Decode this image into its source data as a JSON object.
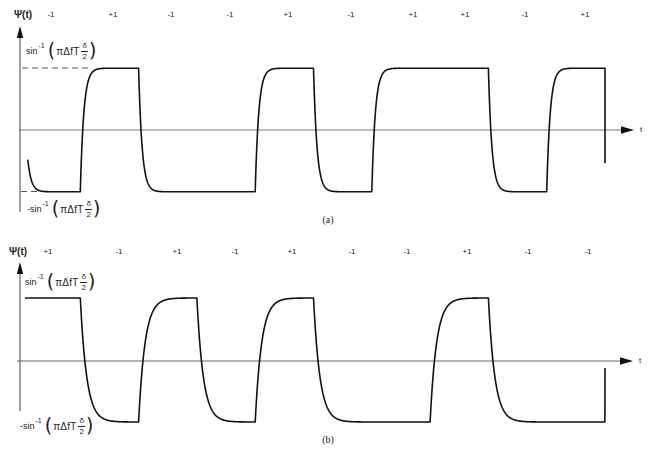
{
  "chart_data": [
    {
      "type": "line",
      "title": "",
      "panel_label": "(a)",
      "ylabel": "Ψ(t)",
      "xlabel": "t",
      "bits": [
        -1,
        1,
        -1,
        -1,
        1,
        -1,
        1,
        1,
        -1,
        1
      ],
      "bit_labels": [
        "-1",
        "+1",
        "-1",
        "-1",
        "+1",
        "-1",
        "+1",
        "+1",
        "-1",
        "+1"
      ],
      "y_tick_labels": {
        "high": {
          "text": "sin⁻¹(πΔfT δ/2)",
          "sign": "",
          "func": "sin",
          "exponent": "-1",
          "open": "(",
          "argument": "πΔfT",
          "numerator": "δ",
          "denominator": "2",
          "close": ")"
        },
        "low": {
          "text": "-sin⁻¹(πΔfT δ/2)",
          "sign": "-",
          "func": "sin",
          "exponent": "-1",
          "open": "(",
          "argument": "πΔfT",
          "numerator": "δ",
          "denominator": "2",
          "close": ")"
        }
      },
      "ylim": [
        -1,
        1
      ],
      "xlim": [
        0,
        10
      ],
      "grid": false,
      "legend_position": "none",
      "waveform": {
        "start_t": 0.1,
        "start_y": -0.48,
        "end_t": 10,
        "end_y": -0.54,
        "time_constant": 0.06
      },
      "transitions": [
        {
          "t": 1,
          "from": -1,
          "to": 1
        },
        {
          "t": 2,
          "from": 1,
          "to": -1
        },
        {
          "t": 4,
          "from": -1,
          "to": 1
        },
        {
          "t": 5,
          "from": 1,
          "to": -1
        },
        {
          "t": 6,
          "from": -1,
          "to": 1
        },
        {
          "t": 8,
          "from": 1,
          "to": -1
        },
        {
          "t": 9,
          "from": -1,
          "to": 1
        },
        {
          "t": 10,
          "from": 1,
          "to": -0.54
        }
      ]
    },
    {
      "type": "line",
      "title": "",
      "panel_label": "(b)",
      "ylabel": "Ψ(t)",
      "xlabel": "t",
      "bits": [
        1,
        -1,
        1,
        -1,
        1,
        -1,
        -1,
        1,
        -1,
        -1
      ],
      "bit_labels": [
        "+1",
        "-1",
        "+1",
        "-1",
        "+1",
        "-1",
        "-1",
        "+1",
        "-1",
        "-1"
      ],
      "y_tick_labels": {
        "high": {
          "text": "sin⁻¹(πΔfT δ/2)",
          "sign": "",
          "func": "sin",
          "exponent": "-1",
          "open": "(",
          "argument": "πΔfT",
          "numerator": "δ",
          "denominator": "2",
          "close": ")"
        },
        "low": {
          "text": "-sin⁻¹(πΔfT δ/2)",
          "sign": "-",
          "func": "sin",
          "exponent": "-1",
          "open": "(",
          "argument": "πΔfT",
          "numerator": "δ",
          "denominator": "2",
          "close": ")"
        }
      },
      "ylim": [
        -1,
        1
      ],
      "xlim": [
        0,
        10
      ],
      "grid": false,
      "legend_position": "none",
      "waveform": {
        "start_t": 0.05,
        "start_y": 1,
        "end_t": 10,
        "end_y": -0.13,
        "time_constant": 0.11
      },
      "transitions": [
        {
          "t": 1,
          "from": 1,
          "to": -1
        },
        {
          "t": 2,
          "from": -1,
          "to": 1
        },
        {
          "t": 3,
          "from": 1,
          "to": -1
        },
        {
          "t": 4,
          "from": -1,
          "to": 1
        },
        {
          "t": 5,
          "from": 1,
          "to": -1
        },
        {
          "t": 7,
          "from": -1,
          "to": 1
        },
        {
          "t": 8,
          "from": 1,
          "to": -1
        },
        {
          "t": 10,
          "from": -1,
          "to": -0.13
        }
      ]
    }
  ]
}
